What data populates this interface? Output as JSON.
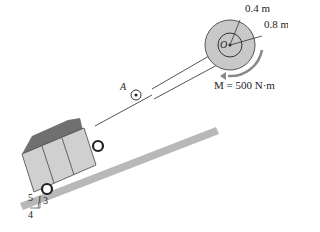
{
  "diagram": {
    "labels": {
      "inner_radius": "0.4 m",
      "outer_radius": "0.8 m",
      "drum_center": "O",
      "pulley": "A",
      "moment": "M = 500 N·m",
      "slope_hyp": "5",
      "slope_rise": "3",
      "slope_run": "4"
    },
    "colors": {
      "drum": "#c8c8c8",
      "incline": "#b0b0b0",
      "cart": "#cfcfcf",
      "coal": "#6e6e6e",
      "line": "#333333"
    }
  }
}
